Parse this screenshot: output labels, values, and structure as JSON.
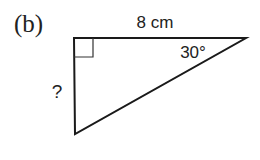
{
  "figure": {
    "label": "(b)",
    "side_top_label": "8 cm",
    "angle_label": "30°",
    "unknown_side_label": "?",
    "right_angle_marker": true,
    "vertices": {
      "right_angle": [
        74,
        38
      ],
      "acute_30": [
        246,
        38
      ],
      "bottom": [
        75,
        134
      ]
    },
    "stroke_color": "#1a1a1a"
  }
}
